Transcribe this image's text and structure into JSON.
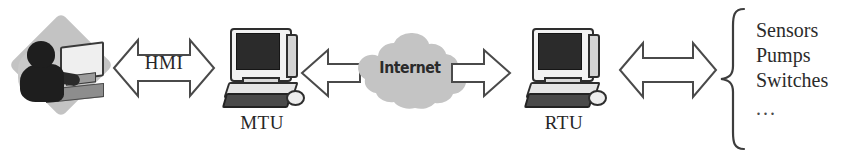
{
  "diagram": {
    "nodes": {
      "operator": {
        "icon": "operator-at-workstation-icon"
      },
      "mtu": {
        "label": "MTU",
        "icon": "desktop-computer-icon"
      },
      "internet": {
        "label": "Internet",
        "icon": "cloud-icon"
      },
      "rtu": {
        "label": "RTU",
        "icon": "desktop-computer-icon"
      }
    },
    "connectors": {
      "operator_to_mtu": {
        "label": "HMI",
        "style": "double-headed-block-arrow"
      },
      "mtu_to_internet": {
        "label": "",
        "style": "single-headed-block-arrow-left"
      },
      "internet_to_rtu": {
        "label": "",
        "style": "single-headed-block-arrow-right"
      },
      "rtu_to_field": {
        "label": "",
        "style": "double-headed-block-arrow"
      }
    },
    "field_devices": {
      "brace": "curly-brace",
      "items": [
        "Sensors",
        "Pumps",
        "Switches"
      ],
      "ellipsis": "..."
    },
    "colors": {
      "background": "#ffffff",
      "outline": "#4a4a4a",
      "text": "#262626",
      "cloud": "#c4c4c4",
      "screen": "#2b2b2b"
    }
  }
}
